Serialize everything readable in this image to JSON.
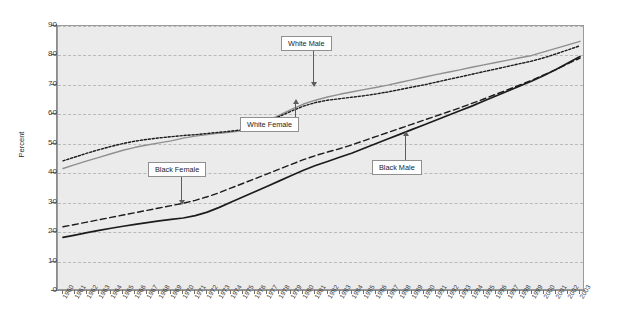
{
  "chart_data": {
    "type": "line",
    "title": "",
    "xlabel": "",
    "ylabel": "Percent",
    "ylim": [
      0,
      90
    ],
    "ytick_step": 10,
    "yticks": [
      0,
      10,
      20,
      30,
      40,
      50,
      60,
      70,
      80,
      90
    ],
    "xlim": [
      1960,
      2003
    ],
    "grid": true,
    "legend_position": "inline-annotations",
    "background_color": "#ebebeb",
    "gridline_color": "#b9b9b9",
    "categories": [
      "1960",
      "1961",
      "1962",
      "1963",
      "1964",
      "1965",
      "1966",
      "1967",
      "1968",
      "1969",
      "1970",
      "1971",
      "1972",
      "1973",
      "1974",
      "1975",
      "1976",
      "1977",
      "1978",
      "1979",
      "1980",
      "1981",
      "1982",
      "1983",
      "1984",
      "1985",
      "1986",
      "1987",
      "1988",
      "1989",
      "1990",
      "1991",
      "1992",
      "1993",
      "1994",
      "1995",
      "1996",
      "1997",
      "1998",
      "1999",
      "2000",
      "2001",
      "2002",
      "2003"
    ],
    "series": [
      {
        "name": "White Male",
        "style": "solid",
        "color": "#8f8f8f",
        "values": [
          41.6,
          42.9,
          44.2,
          45.4,
          46.6,
          47.8,
          48.8,
          49.6,
          50.3,
          51.0,
          51.9,
          52.6,
          53.1,
          53.6,
          54.0,
          54.5,
          56.0,
          57.8,
          59.7,
          61.7,
          63.5,
          64.8,
          65.9,
          66.8,
          67.6,
          68.4,
          69.1,
          69.9,
          70.8,
          71.7,
          72.6,
          73.5,
          74.3,
          75.1,
          76.0,
          76.8,
          77.6,
          78.4,
          79.2,
          80.0,
          81.2,
          82.4,
          83.6,
          84.8
        ]
      },
      {
        "name": "White Female",
        "style": "dotted",
        "color": "#1c1c1c",
        "values": [
          44.2,
          45.5,
          46.8,
          48.0,
          49.1,
          50.1,
          50.9,
          51.5,
          52.0,
          52.4,
          52.8,
          53.1,
          53.5,
          53.9,
          54.3,
          54.8,
          56.1,
          57.6,
          59.3,
          61.1,
          62.8,
          64.0,
          64.8,
          65.3,
          65.8,
          66.3,
          66.9,
          67.6,
          68.4,
          69.2,
          70.0,
          70.9,
          71.8,
          72.7,
          73.6,
          74.5,
          75.4,
          76.3,
          77.2,
          78.1,
          79.2,
          80.5,
          81.9,
          83.3
        ]
      },
      {
        "name": "Black Female",
        "style": "dashed",
        "color": "#1c1c1c",
        "values": [
          21.8,
          22.6,
          23.4,
          24.2,
          25.0,
          25.8,
          26.6,
          27.4,
          28.2,
          29.0,
          29.8,
          30.8,
          32.0,
          33.4,
          35.0,
          36.6,
          38.2,
          39.8,
          41.4,
          43.0,
          44.6,
          46.0,
          47.2,
          48.3,
          49.6,
          51.0,
          52.4,
          53.8,
          55.2,
          56.6,
          58.0,
          59.4,
          60.8,
          62.2,
          63.7,
          65.2,
          66.8,
          68.4,
          70.0,
          71.6,
          73.4,
          75.2,
          77.2,
          79.1
        ]
      },
      {
        "name": "Black Male",
        "style": "solid",
        "color": "#1c1c1c",
        "values": [
          18.2,
          19.0,
          19.8,
          20.6,
          21.3,
          22.0,
          22.6,
          23.2,
          23.8,
          24.3,
          24.8,
          25.6,
          26.8,
          28.4,
          30.2,
          32.0,
          33.8,
          35.6,
          37.4,
          39.2,
          41.0,
          42.6,
          44.0,
          45.4,
          46.8,
          48.4,
          50.0,
          51.6,
          53.2,
          54.8,
          56.4,
          58.0,
          59.6,
          61.2,
          62.8,
          64.5,
          66.2,
          67.9,
          69.6,
          71.3,
          73.2,
          75.2,
          77.4,
          79.6
        ]
      }
    ],
    "annotations": [
      {
        "label": "White Male",
        "arrow": "down",
        "box_x": 281,
        "box_y": 36,
        "tip_x": 313,
        "tip_y": 87
      },
      {
        "label": "White Female",
        "arrow": "up",
        "box_x": 240,
        "box_y": 117,
        "tip_x": 295,
        "tip_y": 99
      },
      {
        "label": "Black Female",
        "arrow": "down",
        "box_x": 148,
        "box_y": 162,
        "tip_x": 181,
        "tip_y": 205
      },
      {
        "label": "Black Male",
        "arrow": "up",
        "box_x": 372,
        "box_y": 160,
        "tip_x": 405,
        "tip_y": 131
      }
    ]
  }
}
